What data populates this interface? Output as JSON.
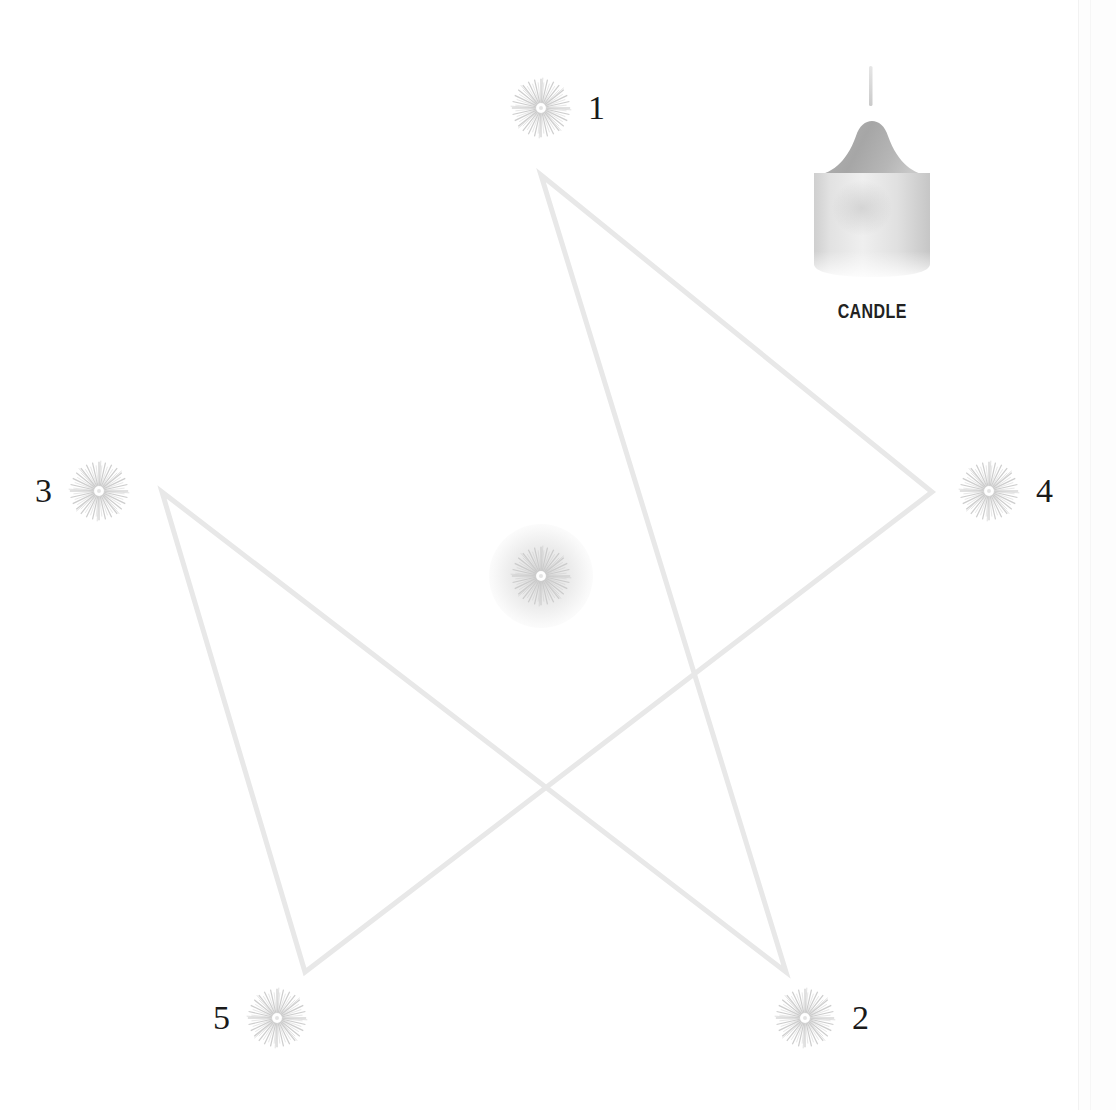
{
  "scene": {
    "title": "Pentagram Candle Ritual",
    "background_color": "#ffffff",
    "width": 1116,
    "height": 1110
  },
  "pentagram": {
    "line_color": "#e8e8e8",
    "line_width": 5,
    "vertices": [
      {
        "name": "top",
        "x": 541,
        "y": 175
      },
      {
        "name": "right",
        "x": 932,
        "y": 492
      },
      {
        "name": "bottom-left",
        "x": 305,
        "y": 972
      },
      {
        "name": "top-left",
        "x": 162,
        "y": 492
      },
      {
        "name": "bottom-right",
        "x": 786,
        "y": 972
      }
    ]
  },
  "nodes": [
    {
      "id": "node-1",
      "label": "1",
      "label_side": "right",
      "x": 541,
      "y": 108,
      "size": 62,
      "glow": false
    },
    {
      "id": "node-2",
      "label": "2",
      "label_side": "right",
      "x": 805,
      "y": 1018,
      "size": 62,
      "glow": false
    },
    {
      "id": "node-3",
      "label": "3",
      "label_side": "left",
      "x": 99,
      "y": 491,
      "size": 62,
      "glow": false
    },
    {
      "id": "node-4",
      "label": "4",
      "label_side": "right",
      "x": 989,
      "y": 491,
      "size": 62,
      "glow": false
    },
    {
      "id": "node-5",
      "label": "5",
      "label_side": "left",
      "x": 277,
      "y": 1018,
      "size": 62,
      "glow": false
    },
    {
      "id": "node-center",
      "label": "",
      "label_side": "right",
      "x": 541,
      "y": 576,
      "size": 62,
      "glow": true
    }
  ],
  "inventory": {
    "item": {
      "name": "candle-item",
      "label": "CANDLE",
      "icon": "candle-icon",
      "body_color": "#d8d8d8",
      "dome_color": "#b8b8b8",
      "wick_color": "#d0d0d0",
      "label_color": "#222222"
    }
  },
  "colors": {
    "background": "#ffffff",
    "line": "#e8e8e8",
    "burst": "#c9c9c9",
    "label_text": "#1a1a1a",
    "panel_edge": "#f2f2f2"
  }
}
